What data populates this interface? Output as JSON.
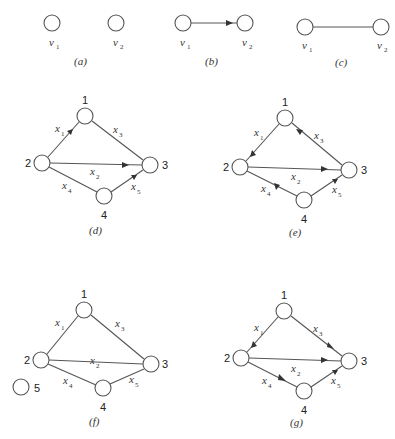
{
  "figure": {
    "panels": [
      {
        "id": "a",
        "caption": "(a)",
        "nodes": [
          {
            "label": "v",
            "sub": "1"
          },
          {
            "label": "v",
            "sub": "2"
          }
        ],
        "edges": []
      },
      {
        "id": "b",
        "caption": "(b)",
        "nodes": [
          {
            "label": "v",
            "sub": "1"
          },
          {
            "label": "v",
            "sub": "2"
          }
        ],
        "edges": [
          {
            "from": "v1",
            "to": "v2",
            "directed": true
          }
        ]
      },
      {
        "id": "c",
        "caption": "(c)",
        "nodes": [
          {
            "label": "v",
            "sub": "1"
          },
          {
            "label": "v",
            "sub": "2"
          }
        ],
        "edges": [
          {
            "from": "v1",
            "to": "v2",
            "directed": false
          }
        ]
      },
      {
        "id": "d",
        "caption": "(d)",
        "nodes": [
          "1",
          "2",
          "3",
          "4"
        ],
        "edges": [
          {
            "label": "x",
            "sub": "1",
            "from": "2",
            "to": "1",
            "directed": true
          },
          {
            "label": "x",
            "sub": "3",
            "from": "1",
            "to": "3",
            "directed": false
          },
          {
            "label": "x",
            "sub": "2",
            "from": "2",
            "to": "3",
            "directed": true
          },
          {
            "label": "x",
            "sub": "4",
            "from": "2",
            "to": "4",
            "directed": false
          },
          {
            "label": "x",
            "sub": "5",
            "from": "4",
            "to": "3",
            "directed": true
          }
        ]
      },
      {
        "id": "e",
        "caption": "(e)",
        "nodes": [
          "1",
          "2",
          "3",
          "4"
        ],
        "edges": [
          {
            "label": "x",
            "sub": "1",
            "from": "1",
            "to": "2",
            "directed": true
          },
          {
            "label": "x",
            "sub": "3",
            "from": "3",
            "to": "1",
            "directed": true
          },
          {
            "label": "x",
            "sub": "2",
            "from": "2",
            "to": "3",
            "directed": true
          },
          {
            "label": "x",
            "sub": "4",
            "from": "4",
            "to": "2",
            "directed": true
          },
          {
            "label": "x",
            "sub": "5",
            "from": "4",
            "to": "3",
            "directed": true
          }
        ]
      },
      {
        "id": "f",
        "caption": "(f)",
        "nodes": [
          "1",
          "2",
          "3",
          "4",
          "5"
        ],
        "edges": [
          {
            "label": "x",
            "sub": "1",
            "from": "2",
            "to": "1",
            "directed": false
          },
          {
            "label": "x",
            "sub": "3",
            "from": "1",
            "to": "3",
            "directed": false
          },
          {
            "label": "x",
            "sub": "2",
            "from": "2",
            "to": "3",
            "directed": false
          },
          {
            "label": "x",
            "sub": "4",
            "from": "2",
            "to": "4",
            "directed": false
          },
          {
            "label": "x",
            "sub": "5",
            "from": "4",
            "to": "3",
            "directed": false
          }
        ]
      },
      {
        "id": "g",
        "caption": "(g)",
        "nodes": [
          "1",
          "2",
          "3",
          "4"
        ],
        "edges": [
          {
            "label": "x",
            "sub": "1",
            "from": "1",
            "to": "2",
            "directed": true
          },
          {
            "label": "x",
            "sub": "3",
            "from": "1",
            "to": "3",
            "directed": true
          },
          {
            "label": "x",
            "sub": "2",
            "from": "2",
            "to": "3",
            "directed": true
          },
          {
            "label": "x",
            "sub": "4",
            "from": "2",
            "to": "4",
            "directed": true
          },
          {
            "label": "x",
            "sub": "5",
            "from": "4",
            "to": "3",
            "directed": true
          }
        ]
      }
    ]
  },
  "labels": {
    "v": "v",
    "x": "x",
    "s1": "1",
    "s2": "2",
    "s3": "3",
    "s4": "4",
    "s5": "5",
    "n1": "1",
    "n2": "2",
    "n3": "3",
    "n4": "4",
    "n5": "5",
    "cap_a": "(a)",
    "cap_b": "(b)",
    "cap_c": "(c)",
    "cap_d": "(d)",
    "cap_e": "(e)",
    "cap_f": "(f)",
    "cap_g": "(g)"
  }
}
